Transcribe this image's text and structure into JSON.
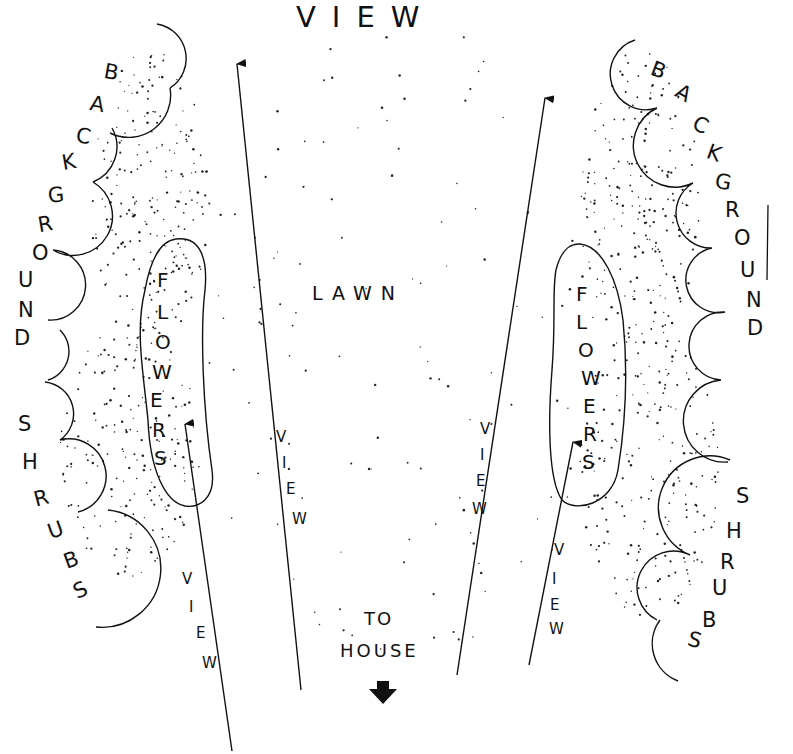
{
  "diagram": {
    "title": "VIEW",
    "center_label": "LAWN",
    "house_label_line1": "TO",
    "house_label_line2": "HOUSE",
    "left_shrubs_label": "BACKGROUND SHRUBS",
    "right_shrubs_label": "BACKGROUND SHRUBS",
    "left_flowers_label": "FLOWERS",
    "right_flowers_label": "FLOWERS",
    "view_arrows": [
      {
        "id": "left-outer",
        "label": "VIEW"
      },
      {
        "id": "left-inner",
        "label": "VIEW"
      },
      {
        "id": "right-inner",
        "label": "VIEW"
      },
      {
        "id": "right-outer",
        "label": "VIEW"
      }
    ],
    "icons": {
      "house_arrow": "down-arrow-icon"
    },
    "colors": {
      "ink": "#111111",
      "paper": "#ffffff"
    }
  }
}
